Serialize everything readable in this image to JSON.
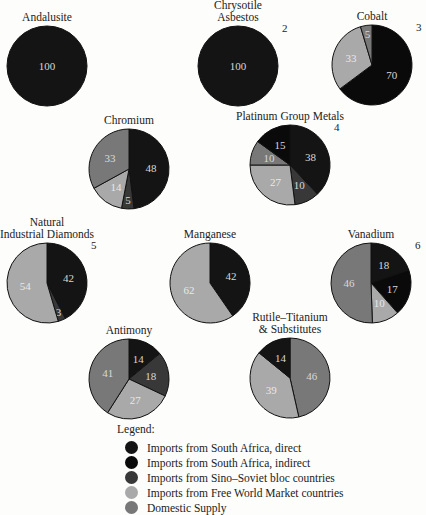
{
  "colors": {
    "sa_direct": "#141414",
    "sa_indirect": "#0a0a0a",
    "sino_soviet": "#383838",
    "free_world": "#a9a9a9",
    "domestic": "#787878"
  },
  "chart_data": {
    "type": "pie",
    "title": "",
    "legend_title": "Legend:",
    "legend": [
      {
        "key": "sa_direct",
        "label": "Imports from South Africa, direct"
      },
      {
        "key": "sa_indirect",
        "label": "Imports from South Africa, indirect"
      },
      {
        "key": "sino_soviet",
        "label": "Imports from Sino–Soviet bloc countries"
      },
      {
        "key": "free_world",
        "label": "Imports from Free World Market countries"
      },
      {
        "key": "domestic",
        "label": "Domestic Supply"
      }
    ],
    "pies": [
      {
        "id": "andalusite",
        "title": [
          "Andalusite"
        ],
        "note": "",
        "cx": 47,
        "cy": 66,
        "r": 40,
        "slices": [
          {
            "key": "sa_direct",
            "value": 100
          }
        ]
      },
      {
        "id": "chrysotile-asbestos",
        "title": [
          "Chrysotile",
          "Asbestos"
        ],
        "note": "2",
        "cx": 238,
        "cy": 66,
        "r": 40,
        "slices": [
          {
            "key": "sa_direct",
            "value": 100
          }
        ]
      },
      {
        "id": "cobalt",
        "title": [
          "Cobalt"
        ],
        "note": "3",
        "cx": 372,
        "cy": 65,
        "r": 40,
        "slices": [
          {
            "key": "sa_indirect",
            "value": 70
          },
          {
            "key": "free_world",
            "value": 33
          },
          {
            "key": "domestic",
            "value": 5
          }
        ]
      },
      {
        "id": "chromium",
        "title": [
          "Chromium"
        ],
        "note": "",
        "cx": 129,
        "cy": 169,
        "r": 40,
        "slices": [
          {
            "key": "sa_direct",
            "value": 48
          },
          {
            "key": "sino_soviet",
            "value": 5
          },
          {
            "key": "free_world",
            "value": 14
          },
          {
            "key": "domestic",
            "value": 33
          }
        ]
      },
      {
        "id": "platinum-group-metals",
        "title": [
          "Platinum Group Metals"
        ],
        "note": "4",
        "cx": 290,
        "cy": 165,
        "r": 40,
        "slices": [
          {
            "key": "sa_direct",
            "value": 38
          },
          {
            "key": "sino_soviet",
            "value": 10
          },
          {
            "key": "free_world",
            "value": 27
          },
          {
            "key": "domestic",
            "value": 10
          },
          {
            "key": "sa_indirect",
            "value": 15
          }
        ]
      },
      {
        "id": "natural-industrial-diamonds",
        "title": [
          "Natural",
          "Industrial Diamonds"
        ],
        "note": "5",
        "cx": 47,
        "cy": 283,
        "r": 40,
        "slices": [
          {
            "key": "sa_direct",
            "value": 42
          },
          {
            "key": "sino_soviet",
            "value": 3
          },
          {
            "key": "free_world",
            "value": 54
          }
        ]
      },
      {
        "id": "manganese",
        "title": [
          "Manganese"
        ],
        "note": "",
        "cx": 210,
        "cy": 283,
        "r": 40,
        "slices": [
          {
            "key": "sa_direct",
            "value": 42
          },
          {
            "key": "free_world",
            "value": 62
          }
        ]
      },
      {
        "id": "vanadium",
        "title": [
          "Vanadium"
        ],
        "note": "6",
        "cx": 371,
        "cy": 283,
        "r": 40,
        "slices": [
          {
            "key": "sa_direct",
            "value": 18
          },
          {
            "key": "sa_indirect",
            "value": 17
          },
          {
            "key": "free_world",
            "value": 10
          },
          {
            "key": "domestic",
            "value": 46
          }
        ]
      },
      {
        "id": "antimony",
        "title": [
          "Antimony"
        ],
        "note": "",
        "cx": 129,
        "cy": 379,
        "r": 40,
        "slices": [
          {
            "key": "sa_direct",
            "value": 14
          },
          {
            "key": "sino_soviet",
            "value": 18
          },
          {
            "key": "free_world",
            "value": 27
          },
          {
            "key": "domestic",
            "value": 41
          }
        ]
      },
      {
        "id": "rutile-titanium",
        "title": [
          "Rutile–Titanium",
          "& Substitutes"
        ],
        "note": "",
        "cx": 290,
        "cy": 378,
        "r": 40,
        "slices": [
          {
            "key": "domestic",
            "value": 46
          },
          {
            "key": "free_world",
            "value": 39
          },
          {
            "key": "sa_direct",
            "value": 14
          }
        ]
      }
    ]
  }
}
